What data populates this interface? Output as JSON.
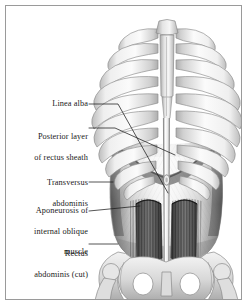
{
  "figure": {
    "frame_color": "#9a9a9a",
    "background_color": "#ffffff",
    "text_color": "#1a1a1a",
    "leader_line_color": "#1c1c1c"
  },
  "labels": [
    {
      "id": "linea-alba",
      "text": "Linea alba",
      "lines": [
        "Linea alba"
      ],
      "x": 28,
      "y": 99,
      "width": 60,
      "leader": {
        "x1": 89,
        "y1": 104,
        "x2": 118,
        "y2": 104,
        "x3": 168,
        "y3": 193
      }
    },
    {
      "id": "posterior-layer-of-rectus-sheath",
      "text": "Posterior layer of rectus sheath",
      "lines": [
        "Posterior layer",
        "of rectus sheath"
      ],
      "x": 16,
      "y": 122,
      "width": 72,
      "leader": {
        "x1": 89,
        "y1": 128,
        "x2": 115,
        "y2": 128,
        "x3": 175,
        "y3": 155
      }
    },
    {
      "id": "transversus-abdominis",
      "text": "Transversus abdominis",
      "lines": [
        "Transversus",
        "abdominis"
      ],
      "x": 24,
      "y": 168,
      "width": 64,
      "leader": {
        "x1": 89,
        "y1": 182,
        "x2": 113,
        "y2": 182
      }
    },
    {
      "id": "aponeurosis-of-internal-oblique-muscle",
      "text": "Aponeurosis of internal oblique muscle",
      "lines": [
        "Aponeurosis of",
        "internal oblique",
        "muscle"
      ],
      "x": 12,
      "y": 196,
      "width": 76,
      "leader": {
        "x1": 89,
        "y1": 211,
        "x2": 140,
        "y2": 206
      }
    },
    {
      "id": "rectus-abdominis-cut",
      "text": "Rectus abdominis (cut)",
      "lines": [
        "Rectus",
        "abdominis (cut)"
      ],
      "x": 10,
      "y": 239,
      "width": 78,
      "leader": {
        "x1": 89,
        "y1": 244,
        "x2": 118,
        "y2": 244
      }
    }
  ],
  "anatomy": {
    "structures": [
      "sternum-manubrium",
      "sternum-body",
      "xiphoid-process",
      "ribs-left",
      "ribs-right",
      "costal-margin",
      "transversus-abdominis",
      "aponeurosis-internal-oblique",
      "linea-alba",
      "umbilical-ring",
      "rectus-abdominis-left-cut",
      "rectus-abdominis-right-cut",
      "iliac-crest-left",
      "iliac-crest-right",
      "obturator-foramen-left",
      "obturator-foramen-right",
      "pubic-symphysis",
      "femur-head-left",
      "femur-head-right"
    ],
    "rib_pairs": 10,
    "bone_color": "#e9e9e9",
    "bone_outline": "#8d8d8d",
    "muscle_dark": "#4a4a4a",
    "muscle_mid": "#8b8b8b",
    "aponeurosis_light": "#f0f0f0"
  }
}
